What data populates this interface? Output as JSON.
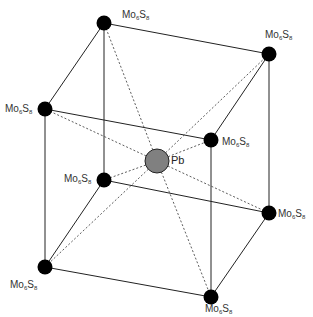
{
  "diagram": {
    "title": "",
    "center_atom": {
      "label": "Pb",
      "x": 157,
      "y": 161,
      "color": "#808080"
    },
    "cluster_label": {
      "base1": "Mo",
      "sub1": "6",
      "base2": "S",
      "sub2": "8"
    },
    "vertices": [
      {
        "id": "back-top-left",
        "x": 104,
        "y": 23,
        "label_x": 122,
        "label_y": 10
      },
      {
        "id": "back-top-right",
        "x": 269,
        "y": 54,
        "label_x": 265,
        "label_y": 30
      },
      {
        "id": "front-top-left",
        "x": 45,
        "y": 109,
        "label_x": 5,
        "label_y": 104
      },
      {
        "id": "front-top-right",
        "x": 211,
        "y": 140,
        "label_x": 222,
        "label_y": 137
      },
      {
        "id": "back-bottom-left",
        "x": 104,
        "y": 180,
        "label_x": 64,
        "label_y": 174
      },
      {
        "id": "back-bottom-right",
        "x": 269,
        "y": 213,
        "label_x": 278,
        "label_y": 209
      },
      {
        "id": "front-bottom-left",
        "x": 45,
        "y": 267,
        "label_x": 10,
        "label_y": 280
      },
      {
        "id": "front-bottom-right",
        "x": 211,
        "y": 297,
        "label_x": 205,
        "label_y": 304
      }
    ],
    "vertex_color": "#000000",
    "edge_color": "#222222",
    "dashed_color": "#333333"
  }
}
